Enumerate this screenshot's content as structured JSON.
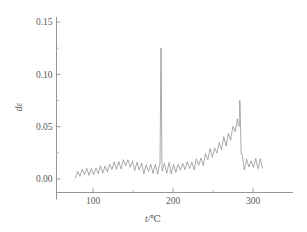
{
  "chart_data": {
    "type": "line",
    "title": "",
    "xlabel": "t/℃",
    "ylabel": "dε",
    "xlim": [
      65,
      330
    ],
    "ylim": [
      -0.012,
      0.155
    ],
    "grid": false,
    "legend": null,
    "x_ticks_major": [
      100,
      200,
      300
    ],
    "x_tick_labels": [
      "100",
      "200",
      "300"
    ],
    "x_ticks_minor": [
      150,
      250
    ],
    "y_ticks_major": [
      0.0,
      0.05,
      0.1,
      0.15
    ],
    "y_tick_labels": [
      "0.00",
      "0.05",
      "0.10",
      "0.15"
    ],
    "y_ticks_minor": [
      0.025,
      0.075,
      0.125
    ],
    "line_color": "#7d7d7d",
    "axis_color": "#8a8a8a",
    "background_color": "#ffffff",
    "series": [
      {
        "name": "dε",
        "description": "Dense sawtooth oscillation on a slowly varying baseline with a sharp narrow spike near 185 °C and a broad rising peak near 283 °C followed by an abrupt drop.",
        "x_start": 78,
        "x_end": 312,
        "oscillation_cycles": 41,
        "baseline_envelope_x": [
          78,
          92,
          110,
          128,
          142,
          152,
          163,
          172,
          188,
          205,
          222,
          238,
          252,
          262,
          272,
          280,
          284,
          286,
          292,
          300,
          312
        ],
        "baseline_envelope_y": [
          0.004,
          0.007,
          0.009,
          0.012,
          0.016,
          0.013,
          0.01,
          0.01,
          0.01,
          0.011,
          0.013,
          0.018,
          0.026,
          0.033,
          0.042,
          0.052,
          0.058,
          0.016,
          0.014,
          0.015,
          0.014
        ],
        "oscillation_amplitude_x": [
          78,
          110,
          142,
          163,
          188,
          222,
          252,
          272,
          284,
          292,
          312
        ],
        "oscillation_amplitude_y": [
          0.005,
          0.006,
          0.007,
          0.007,
          0.008,
          0.008,
          0.009,
          0.011,
          0.013,
          0.008,
          0.008
        ],
        "spikes": [
          {
            "x": 185.0,
            "y": 0.125,
            "label": "sharp narrow spike"
          },
          {
            "x": 283.5,
            "y": 0.075,
            "label": "broad peak apex"
          }
        ],
        "notable_points": [
          {
            "x": 78,
            "y": 0.004
          },
          {
            "x": 100,
            "y": 0.008
          },
          {
            "x": 140,
            "y": 0.02
          },
          {
            "x": 160,
            "y": 0.01
          },
          {
            "x": 185,
            "y": 0.125
          },
          {
            "x": 200,
            "y": 0.011
          },
          {
            "x": 240,
            "y": 0.018
          },
          {
            "x": 265,
            "y": 0.038
          },
          {
            "x": 283,
            "y": 0.075
          },
          {
            "x": 287,
            "y": 0.012
          },
          {
            "x": 300,
            "y": 0.022
          },
          {
            "x": 312,
            "y": 0.013
          }
        ]
      }
    ]
  }
}
